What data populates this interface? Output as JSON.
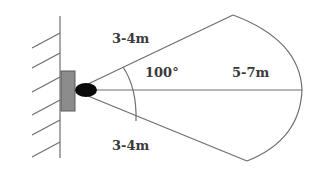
{
  "diagram": {
    "labels": {
      "upper_range": "3-4m",
      "lower_range": "3-4m",
      "angle": "100°",
      "center_range": "5-7m"
    },
    "elements": {
      "wall": "wall-with-hatching",
      "mount": "sensor-mount-plate",
      "sensor": "sensor-lens"
    },
    "colors": {
      "line": "#6e6e6e",
      "mount_fill": "#8c8c8c",
      "sensor_fill": "#0a0a0a",
      "text": "#3a3a3a",
      "background": "#ffffff"
    }
  }
}
